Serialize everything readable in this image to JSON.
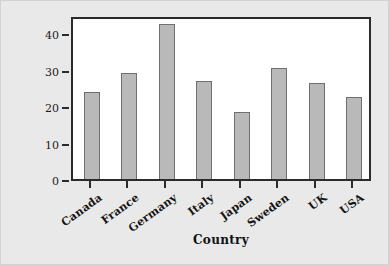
{
  "chart_data": {
    "type": "bar",
    "title": "",
    "categories": [
      "Canada",
      "France",
      "Germany",
      "Italy",
      "Japan",
      "Sweden",
      "UK",
      "USA"
    ],
    "values": [
      24.0,
      29.0,
      42.5,
      26.8,
      18.5,
      30.4,
      26.3,
      22.4
    ],
    "xlabel": "Country",
    "ylabel": "Taxes as percentage of gross wage earnings",
    "ylim": [
      0,
      45
    ],
    "yticks": [
      0,
      10,
      20,
      30,
      40
    ],
    "ytick_labels": [
      "0",
      "10",
      "20",
      "30",
      "40"
    ],
    "grid": false,
    "legend": null,
    "series": [
      {
        "name": "Taxes as percentage of gross wage earnings",
        "values": [
          24.0,
          29.0,
          42.5,
          26.8,
          18.5,
          30.4,
          26.3,
          22.4
        ]
      }
    ]
  },
  "style": {
    "bar_fill": "#b9b9b9",
    "bar_edge": "#6f6f6f",
    "frame_color": "#2b2b2b",
    "plot_background": "#ffffff",
    "figure_background": "#e9e9e9",
    "text_color": "#111111"
  }
}
